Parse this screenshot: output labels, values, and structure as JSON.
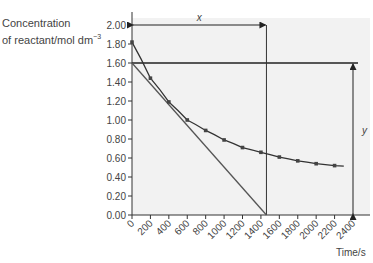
{
  "chart_data": {
    "type": "line",
    "title": "",
    "ylabel_line1": "Concentration",
    "ylabel_line2": "of reactant/mol dm",
    "ylabel_sup": "−3",
    "xlabel": "Time/s",
    "xlim": [
      0,
      2400
    ],
    "ylim": [
      0,
      2.0
    ],
    "x_ticks": [
      "0",
      "200",
      "400",
      "600",
      "800",
      "1000",
      "1200",
      "1400",
      "1600",
      "1800",
      "2000",
      "2200",
      "2400"
    ],
    "y_ticks": [
      "0.00",
      "0.20",
      "0.40",
      "0.60",
      "0.80",
      "1.00",
      "1.20",
      "1.40",
      "1.60",
      "1.80",
      "2.00"
    ],
    "grid": false,
    "background": "#f2f2f2",
    "series": [
      {
        "name": "concentration curve",
        "x": [
          0,
          200,
          400,
          600,
          800,
          1000,
          1200,
          1400,
          1600,
          1800,
          2000,
          2200
        ],
        "values": [
          1.82,
          1.44,
          1.19,
          1.0,
          0.89,
          0.79,
          0.71,
          0.66,
          0.61,
          0.57,
          0.54,
          0.52
        ]
      },
      {
        "name": "tangent at t=0",
        "x": [
          0,
          1460
        ],
        "values": [
          1.6,
          0.0
        ]
      }
    ],
    "annotations": [
      {
        "label": "x",
        "type": "double-arrow horizontal",
        "from": [
          0,
          2.0
        ],
        "to": [
          1460,
          2.0
        ]
      },
      {
        "label": "y",
        "type": "double-arrow vertical",
        "from": [
          2400,
          0.0
        ],
        "to": [
          2400,
          1.6
        ]
      },
      {
        "type": "horizontal line",
        "y": 1.6
      },
      {
        "type": "vertical line",
        "x": 1460
      }
    ]
  }
}
